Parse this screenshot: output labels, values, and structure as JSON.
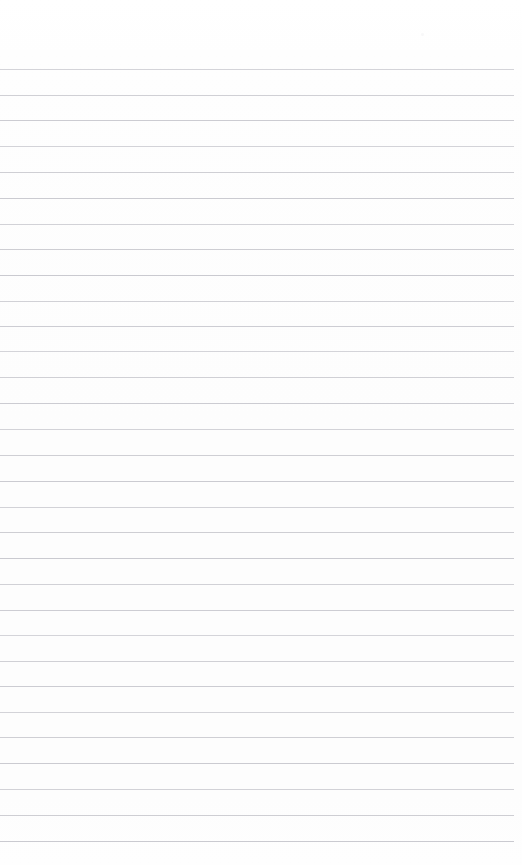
{
  "document": {
    "kind": "scanned-lined-paper",
    "orientation": "portrait",
    "page_width": 522,
    "page_height": 865,
    "background_color": "#fefefe",
    "text_content": "",
    "has_handwriting": false,
    "has_printed_text": false
  },
  "ruling": {
    "line_color": "#c9c9cf",
    "line_thickness": 1,
    "line_count": 31,
    "line_left": 0,
    "line_right": 514,
    "line_length": 514,
    "first_line_y": 69,
    "spacing": 25.7,
    "top_margin": 69,
    "bottom_margin": 24,
    "right_margin": 8,
    "left_margin": 0,
    "line_positions": [
      69,
      95,
      120,
      146,
      172,
      198,
      224,
      249,
      275,
      301,
      326,
      351,
      377,
      403,
      429,
      455,
      481,
      507,
      532,
      558,
      584,
      610,
      635,
      661,
      686,
      712,
      737,
      763,
      789,
      815,
      841
    ]
  },
  "artifacts": {
    "specks": [
      {
        "x": 421,
        "y": 33,
        "size": 3
      }
    ]
  }
}
